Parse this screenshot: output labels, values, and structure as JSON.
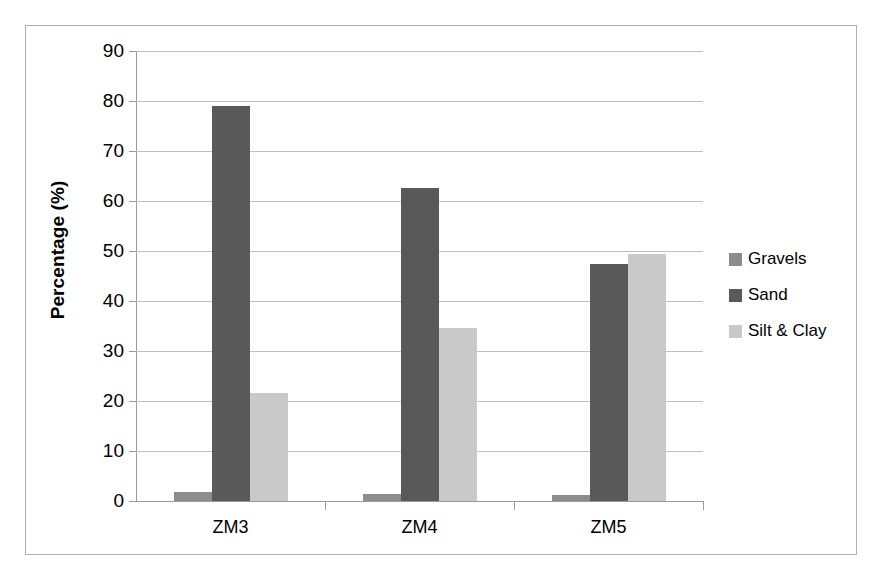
{
  "chart_data": {
    "type": "bar",
    "title": "",
    "subtitle": "",
    "xlabel": "",
    "ylabel": "Percentage (%)",
    "categories": [
      "ZM3",
      "ZM4",
      "ZM5"
    ],
    "series": [
      {
        "name": "Gravels",
        "color": "#8c8c8c",
        "values": [
          1.8,
          1.5,
          1.3
        ]
      },
      {
        "name": "Sand",
        "color": "#595959",
        "values": [
          79.0,
          62.6,
          47.5
        ]
      },
      {
        "name": "Silt & Clay",
        "color": "#c9c9c9",
        "values": [
          21.7,
          34.6,
          49.5
        ]
      }
    ],
    "ylim": [
      0,
      90
    ],
    "yticks": [
      0,
      10,
      20,
      30,
      40,
      50,
      60,
      70,
      80,
      90
    ],
    "ytick_labels": [
      "0",
      "10",
      "20",
      "30",
      "40",
      "50",
      "60",
      "70",
      "80",
      "90"
    ],
    "grid": "horizontal",
    "legend_position": "right",
    "bar_grouping": "grouped",
    "plot_background": "#ffffff",
    "gridline_color": "#bfbfbf",
    "axis_color": "#9a9a9a",
    "frame_border_color": "#b0b0b0"
  }
}
